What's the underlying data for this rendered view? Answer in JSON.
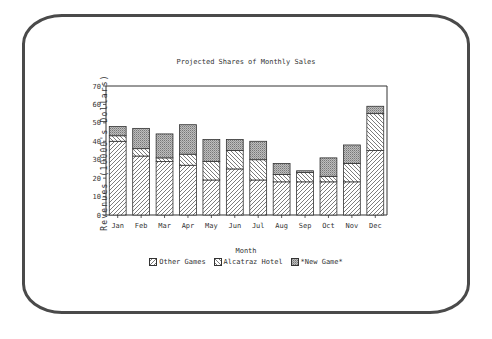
{
  "chart_data": {
    "type": "bar",
    "stacked": true,
    "title": "Projected Shares of Monthly Sales",
    "xlabel": "Month",
    "ylabel": "Revenues (10000's Dollars)",
    "ylim": [
      0,
      70
    ],
    "yticks": [
      0,
      10,
      20,
      30,
      40,
      50,
      60,
      70
    ],
    "grid": false,
    "legend_position": "bottom",
    "categories": [
      "Jan",
      "Feb",
      "Mar",
      "Apr",
      "May",
      "Jun",
      "Jul",
      "Aug",
      "Sep",
      "Oct",
      "Nov",
      "Dec"
    ],
    "series": [
      {
        "name": "Other Games",
        "pattern": "forward-diagonal-hatch",
        "values": [
          40,
          32,
          29,
          27,
          19,
          25,
          19,
          18,
          18,
          18,
          18,
          35
        ]
      },
      {
        "name": "Alcatraz Hotel",
        "pattern": "back-diagonal-hatch",
        "values": [
          3,
          4,
          2,
          6,
          10,
          10,
          11,
          4,
          5,
          3,
          10,
          20
        ]
      },
      {
        "name": "*New Game*",
        "pattern": "dense-stipple",
        "values": [
          5,
          11,
          13,
          16,
          12,
          6,
          10,
          6,
          1,
          10,
          10,
          4
        ]
      }
    ]
  },
  "frame_color": "#4a4a4a",
  "ink_color": "#333333"
}
